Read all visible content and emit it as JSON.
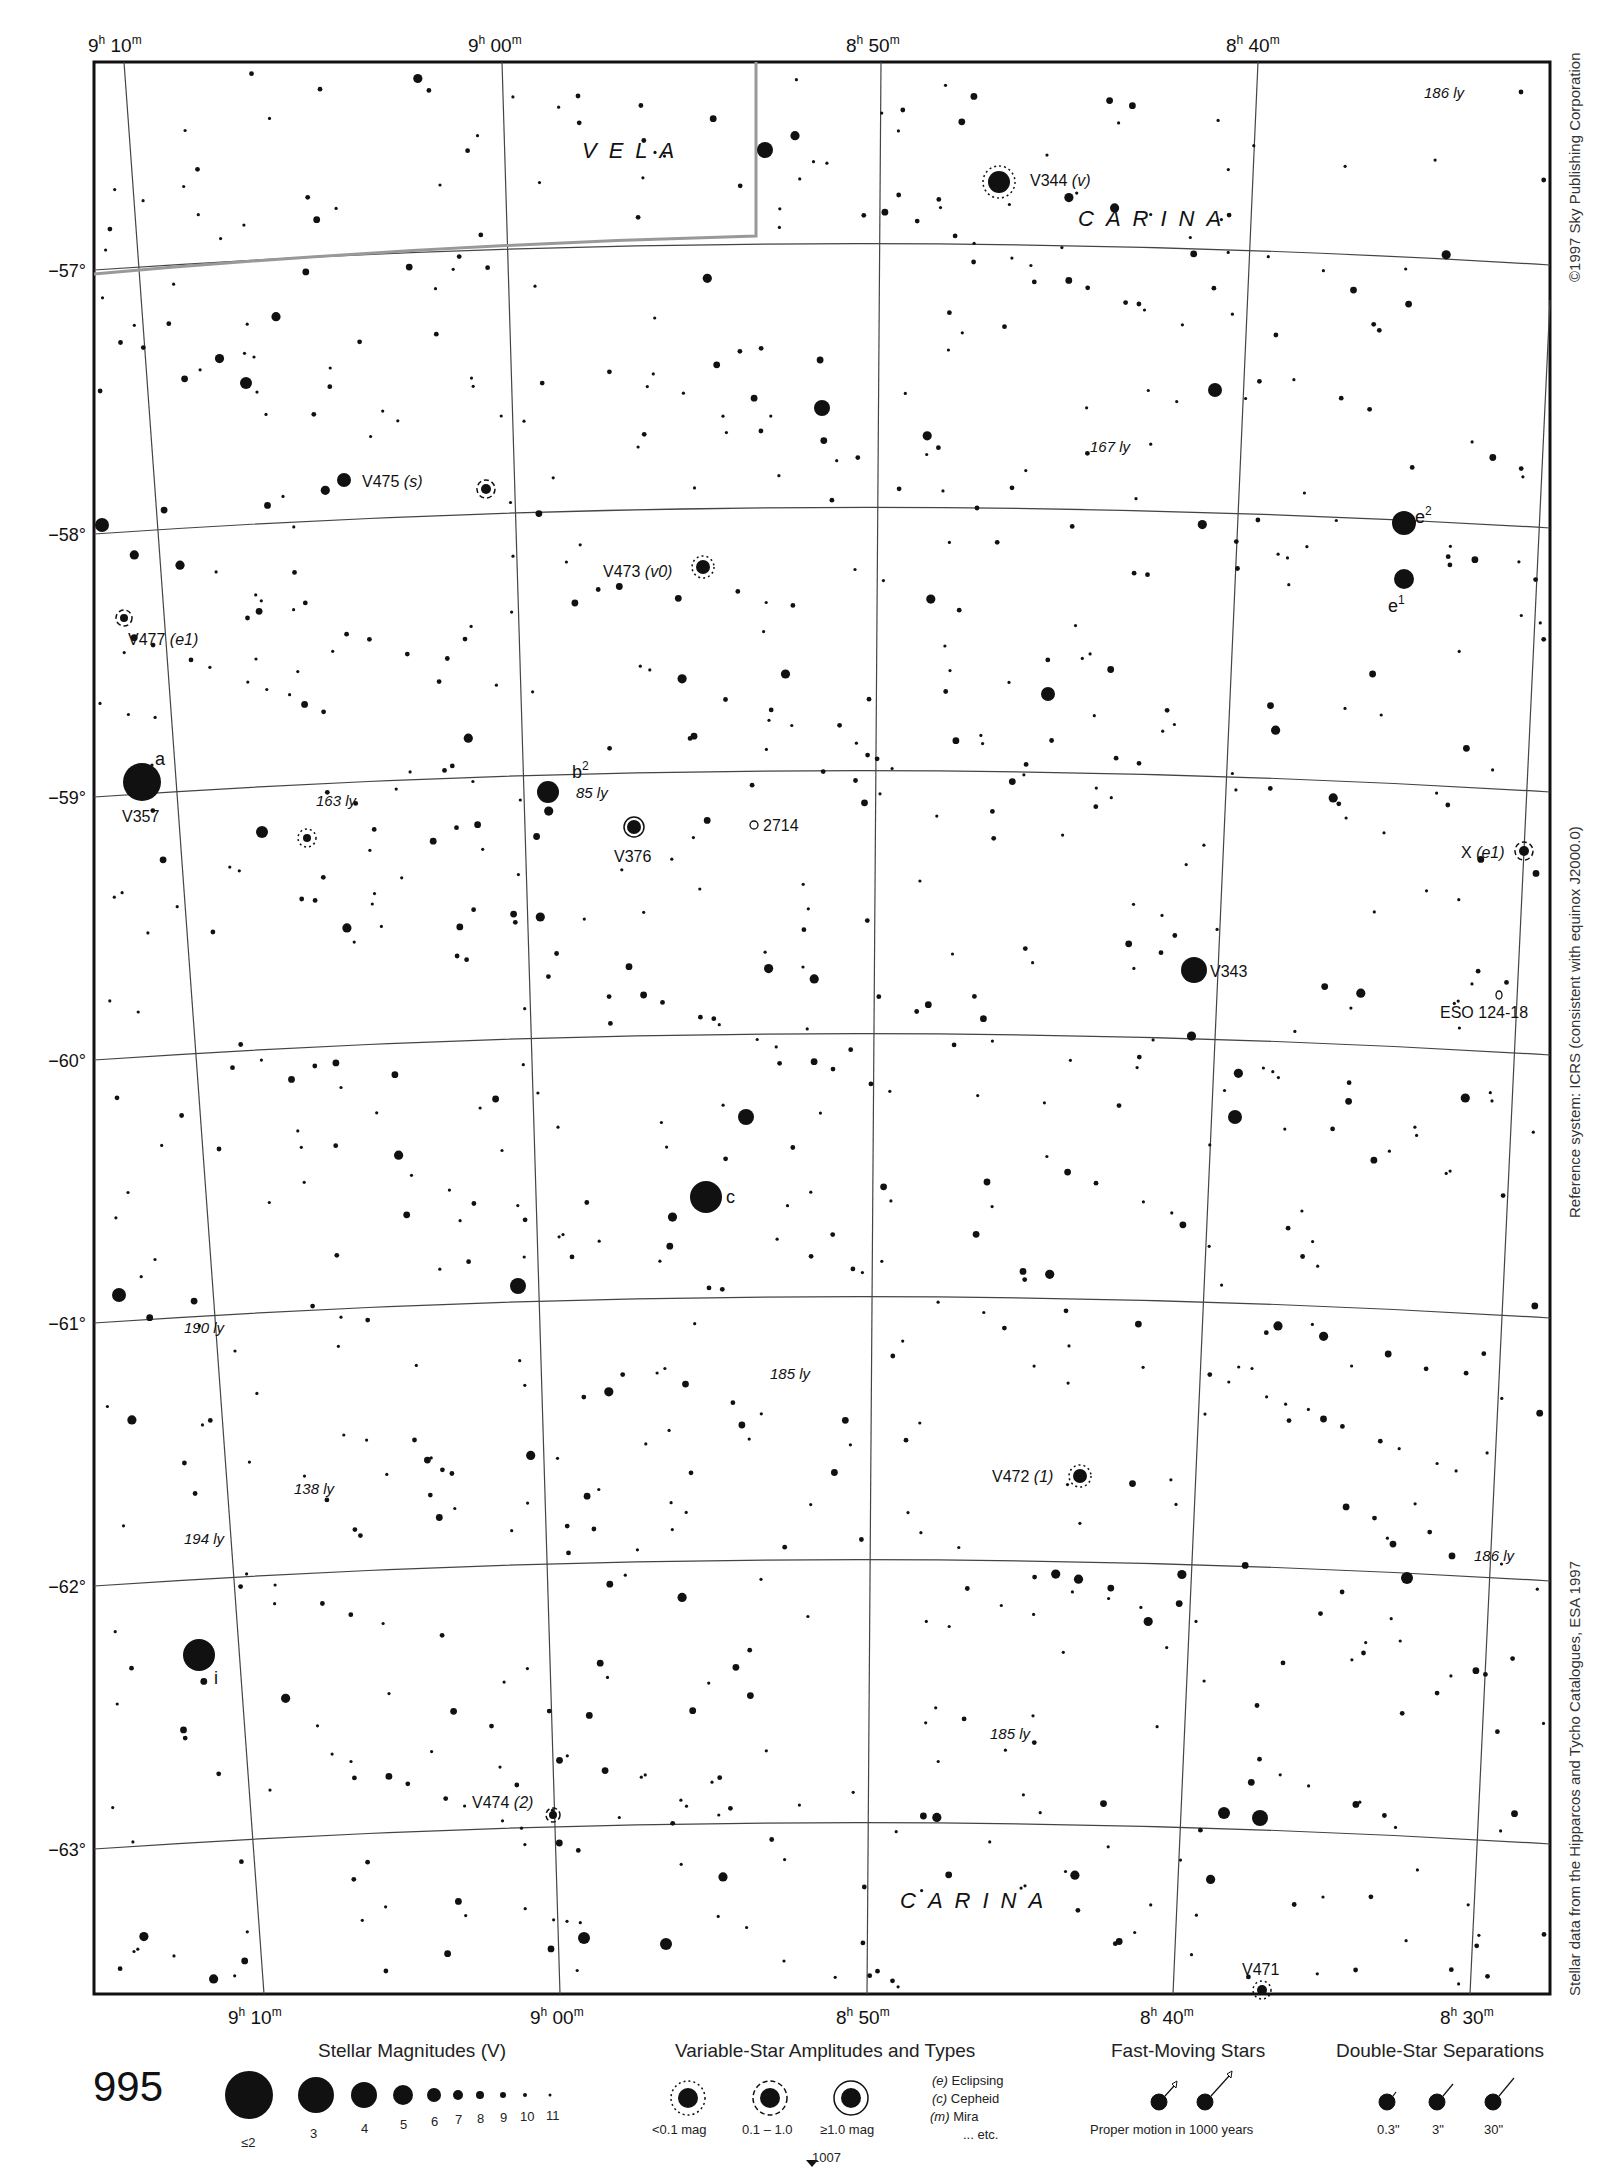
{
  "page": {
    "chart_number": "995",
    "adjacent_chart_below": "1007",
    "credits": {
      "copyright": "©1997 Sky Publishing Corporation",
      "reference_system": "Reference system: ICRS (consistent with equinox J2000.0)",
      "data_source": "Stellar data from the Hipparcos and Tycho Catalogues, ESA 1997"
    }
  },
  "axes": {
    "ra_top": [
      {
        "label_h": "9",
        "label_m": "10",
        "x": 88
      },
      {
        "label_h": "9",
        "label_m": "00",
        "x": 468
      },
      {
        "label_h": "8",
        "label_m": "50",
        "x": 850
      },
      {
        "label_h": "8",
        "label_m": "40",
        "x": 1228
      }
    ],
    "ra_bottom": [
      {
        "label_h": "9",
        "label_m": "10",
        "x": 232
      },
      {
        "label_h": "9",
        "label_m": "00",
        "x": 532
      },
      {
        "label_h": "8",
        "label_m": "50",
        "x": 838
      },
      {
        "label_h": "8",
        "label_m": "40",
        "x": 1142
      },
      {
        "label_h": "8",
        "label_m": "30",
        "x": 1443
      }
    ],
    "dec": [
      {
        "label": "−57°",
        "y": 270
      },
      {
        "label": "−58°",
        "y": 534
      },
      {
        "label": "−59°",
        "y": 797
      },
      {
        "label": "−60°",
        "y": 1060
      },
      {
        "label": "−61°",
        "y": 1323
      },
      {
        "label": "−62°",
        "y": 1586
      },
      {
        "label": "−63°",
        "y": 1849
      }
    ]
  },
  "constellations": [
    {
      "name": "VELA",
      "x": 582,
      "y": 150
    },
    {
      "name": "CARINA",
      "x": 1080,
      "y": 220
    },
    {
      "name": "CARINA",
      "x": 900,
      "y": 1900
    }
  ],
  "labels": {
    "variables": [
      {
        "text": "V344",
        "suffix": "(v)",
        "x": 1030,
        "y": 186
      },
      {
        "text": "V475",
        "suffix": "(s)",
        "x": 362,
        "y": 487
      },
      {
        "text": "V473",
        "suffix": "(v0)",
        "x": 603,
        "y": 577
      },
      {
        "text": "V477",
        "suffix": "(e1)",
        "x": 128,
        "y": 645
      },
      {
        "text": "V357",
        "suffix": "",
        "x": 124,
        "y": 822
      },
      {
        "text": "V376",
        "suffix": "",
        "x": 614,
        "y": 862
      },
      {
        "text": "V343",
        "suffix": "",
        "x": 1212,
        "y": 980
      },
      {
        "text": "X",
        "suffix": "(e1)",
        "x": 1461,
        "y": 860
      },
      {
        "text": "V472",
        "suffix": "(1)",
        "x": 992,
        "y": 1479
      },
      {
        "text": "V474",
        "suffix": "(2)",
        "x": 472,
        "y": 1808
      },
      {
        "text": "V471",
        "suffix": "",
        "x": 1242,
        "y": 1975
      }
    ],
    "bayer": [
      {
        "text": "a",
        "x": 155,
        "y": 765
      },
      {
        "text": "b",
        "sup": "2",
        "x": 578,
        "y": 775
      },
      {
        "text": "c",
        "x": 728,
        "y": 1206
      },
      {
        "text": "e",
        "sup": "2",
        "x": 1415,
        "y": 522
      },
      {
        "text": "e",
        "sup": "1",
        "x": 1390,
        "y": 610
      },
      {
        "text": "i",
        "x": 215,
        "y": 1690
      }
    ],
    "distances": [
      {
        "text": "186 ly",
        "x": 1424,
        "y": 100
      },
      {
        "text": "167 ly",
        "x": 1090,
        "y": 454
      },
      {
        "text": "163 ly",
        "x": 314,
        "y": 808
      },
      {
        "text": "85 ly",
        "x": 578,
        "y": 800
      },
      {
        "text": "190 ly",
        "x": 184,
        "y": 1333
      },
      {
        "text": "185 ly",
        "x": 768,
        "y": 1380
      },
      {
        "text": "138 ly",
        "x": 294,
        "y": 1494
      },
      {
        "text": "194 ly",
        "x": 184,
        "y": 1544
      },
      {
        "text": "186 ly",
        "x": 1474,
        "y": 1561
      },
      {
        "text": "185 ly",
        "x": 990,
        "y": 1740
      }
    ],
    "deep_sky": [
      {
        "text": "2714",
        "x": 765,
        "y": 830
      },
      {
        "text": "ESO 124-18",
        "x": 1440,
        "y": 1018
      }
    ]
  },
  "legend": {
    "magnitudes": {
      "title": "Stellar Magnitudes (V)",
      "entries": [
        {
          "label": "≤2",
          "r": 24
        },
        {
          "label": "3",
          "r": 18
        },
        {
          "label": "4",
          "r": 13
        },
        {
          "label": "5",
          "r": 10
        },
        {
          "label": "6",
          "r": 7
        },
        {
          "label": "7",
          "r": 5
        },
        {
          "label": "8",
          "r": 4
        },
        {
          "label": "9",
          "r": 3
        },
        {
          "label": "10",
          "r": 2
        },
        {
          "label": "11",
          "r": 1.5
        }
      ]
    },
    "variables": {
      "title": "Variable-Star Amplitudes and Types",
      "amplitudes": [
        "<0.1 mag",
        "0.1 – 1.0",
        "≥1.0 mag"
      ],
      "types": [
        {
          "code": "(e)",
          "name": "Eclipsing"
        },
        {
          "code": "(c)",
          "name": "Cepheid"
        },
        {
          "code": "(m)",
          "name": "Mira"
        },
        {
          "code": "",
          "name": "... etc."
        }
      ]
    },
    "fast_moving": {
      "title": "Fast-Moving Stars",
      "caption": "Proper motion in 1000 years"
    },
    "doubles": {
      "title": "Double-Star Separations",
      "separations": [
        "0.3\"",
        "3\"",
        "30\""
      ]
    }
  },
  "chart_data": {
    "type": "scatter",
    "xlabel": "Right Ascension",
    "ylabel": "Declination",
    "ra_range": [
      "9h 12m",
      "8h 28m"
    ],
    "dec_range": [
      -56.4,
      -63.5
    ],
    "grid": true,
    "bright_stars": [
      {
        "name": "a Car (V357)",
        "x": 142,
        "y": 782,
        "mag": 3
      },
      {
        "name": "c Car",
        "x": 706,
        "y": 1197,
        "mag": 4
      },
      {
        "name": "i Car",
        "x": 199,
        "y": 1655,
        "mag": 4
      },
      {
        "name": "e2 Vel/Car",
        "x": 1404,
        "y": 523,
        "mag": 4
      },
      {
        "name": "e1",
        "x": 1404,
        "y": 579,
        "mag": 4.5
      },
      {
        "name": "V343",
        "x": 1194,
        "y": 970,
        "mag": 4
      },
      {
        "name": "b2",
        "x": 548,
        "y": 792,
        "mag": 5
      },
      {
        "name": "V344",
        "x": 999,
        "y": 182,
        "mag": 5
      },
      {
        "name": "V376",
        "x": 634,
        "y": 827,
        "mag": 5.5
      }
    ]
  }
}
